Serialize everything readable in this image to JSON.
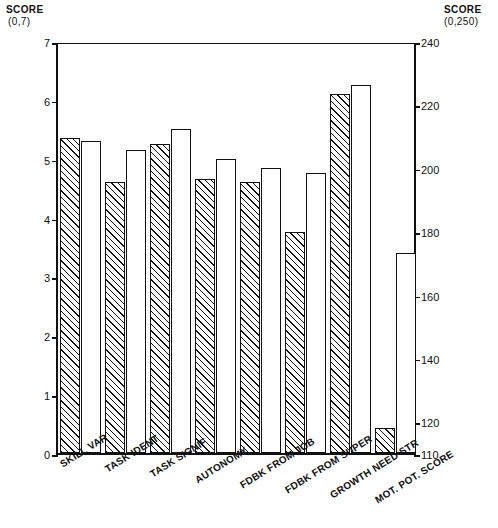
{
  "left_axis": {
    "title": "SCORE",
    "range_label": "(0,7)",
    "ticks": [
      "0",
      "1",
      "2",
      "3",
      "4",
      "5",
      "6",
      "7"
    ]
  },
  "right_axis": {
    "title": "SCORE",
    "range_label": "(0,250)",
    "ticks": [
      "110",
      "120",
      "140",
      "160",
      "180",
      "200",
      "220",
      "240"
    ]
  },
  "chart_data": {
    "type": "bar",
    "title": "",
    "xlabel": "",
    "ylabel": "SCORE",
    "grid": false,
    "legend": "none",
    "categories": [
      "SKILL VAR",
      "TASK IDENT",
      "TASK SIGNIF",
      "AUTONOMY",
      "FDBK FROM JOB",
      "FDBK FROM SUPER",
      "GROWTH NEED STR",
      "MOT. POT. SCORE"
    ],
    "y_left_lim": [
      0,
      7
    ],
    "y_right_lim": [
      110,
      240
    ],
    "series": [
      {
        "name": "hatched",
        "fill": "diagonal-hatch",
        "values": [
          5.35,
          4.6,
          5.25,
          4.65,
          4.6,
          3.75,
          6.1,
          1.0
        ],
        "values_right_scale": [
          null,
          null,
          null,
          null,
          null,
          null,
          null,
          118
        ]
      },
      {
        "name": "open",
        "fill": "white",
        "values": [
          5.3,
          5.15,
          5.5,
          5.0,
          4.85,
          4.75,
          6.25,
          3.75
        ],
        "values_right_scale": [
          null,
          null,
          null,
          null,
          null,
          null,
          null,
          173
        ]
      }
    ],
    "note": "Last category (MOT. POT. SCORE) is read against the right-hand 110-240 axis."
  }
}
